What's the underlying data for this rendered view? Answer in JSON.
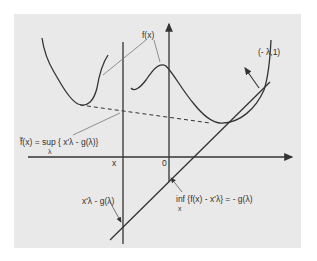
{
  "diagram": {
    "type": "convex-conjugate-duality",
    "labels": {
      "fx": "f(x)",
      "normal": "(- λ,1)",
      "conjugate_main": "f̃(x) = sup { x'λ - g(λ)}",
      "conjugate_sub": "λ",
      "x_tick": "x",
      "origin": "0",
      "line_label": "x'λ - g(λ)",
      "inf_main": "inf {f(x) - x'λ} = - g(λ)",
      "inf_sub": "x"
    },
    "colors": {
      "background": "#ffffff",
      "panel": "#e9e9ea",
      "stroke": "#333333",
      "leader": "#555555"
    }
  }
}
